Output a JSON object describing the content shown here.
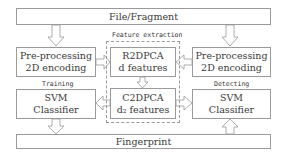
{
  "diagram": {
    "top_box": {
      "label": "File/Fragment"
    },
    "bottom_box": {
      "label": "Fingerprint"
    },
    "left_column": {
      "section_label": "Training",
      "preprocess": {
        "line1": "Pre-processing",
        "line2": "2D encoding"
      },
      "classifier": {
        "line1": "SVM",
        "line2": "Classifier"
      }
    },
    "right_column": {
      "section_label": "Detecting",
      "preprocess": {
        "line1": "Pre-processing",
        "line2": "2D encoding"
      },
      "classifier": {
        "line1": "SVM",
        "line2": "Classifier"
      }
    },
    "center": {
      "group_label": "Feature extraction",
      "r2dpca": {
        "line1": "R2DPCA",
        "line2": "d features"
      },
      "c2dpca": {
        "line1": "C2DPCA",
        "line2": "d₂ features"
      }
    },
    "colors": {
      "border": "#9a9a9a",
      "text": "#3a3a3a",
      "background": "#ffffff"
    }
  }
}
